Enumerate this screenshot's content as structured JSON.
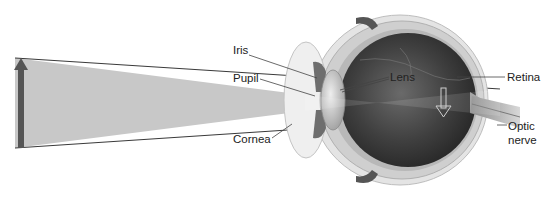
{
  "diagram": {
    "labels": {
      "iris": "Iris",
      "pupil": "Pupil",
      "cornea": "Cornea",
      "lens": "Lens",
      "retina": "Retina",
      "optic_nerve_line1": "Optic",
      "optic_nerve_line2": "nerve"
    },
    "colors": {
      "beam_fill": "#c8c8c8",
      "beam_edge": "#3a3a3a",
      "object_arrow": "#555555",
      "eye_interior": "#3c3c3c",
      "sclera": "#c9c9c9",
      "label_text": "#222222"
    },
    "elements": {
      "object_arrow": "upright object (arrow)",
      "image_arrow": "inverted image on retina"
    }
  }
}
